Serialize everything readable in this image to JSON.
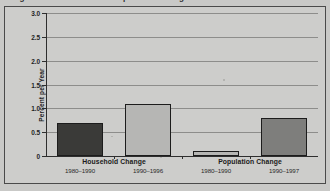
{
  "figure": {
    "cropped_title": "Figure 2. Household and Population Change",
    "frame_color": "#4a4a4a",
    "background_color": "#cdcdcb"
  },
  "chart_data": {
    "type": "bar",
    "title": "Household and Population Change",
    "xlabel": "",
    "ylabel": "Percent per Year",
    "ylim": [
      0,
      3.0
    ],
    "ytick_labels": [
      "0",
      "0.5",
      "1.0",
      "1.5",
      "2.0",
      "2.5",
      "3.0"
    ],
    "ytick_values": [
      0,
      0.5,
      1.0,
      1.5,
      2.0,
      2.5,
      3.0
    ],
    "grid": "horizontal",
    "legend": "none",
    "groups": [
      {
        "name": "Household Change",
        "categories": [
          "1980–1990",
          "1990–1996"
        ],
        "values": [
          0.7,
          1.1
        ],
        "colors": [
          "#3a3a38",
          "#b6b6b4"
        ]
      },
      {
        "name": "Population Change",
        "categories": [
          "1980–1990",
          "1990–1997"
        ],
        "values": [
          0.1,
          0.8
        ],
        "colors": [
          "#b6b6b4",
          "#7e7e7c"
        ]
      }
    ],
    "categories": [
      "1980–1990",
      "1990–1996",
      "1980–1990",
      "1990–1997"
    ],
    "values": [
      0.7,
      1.1,
      0.1,
      0.8
    ]
  }
}
